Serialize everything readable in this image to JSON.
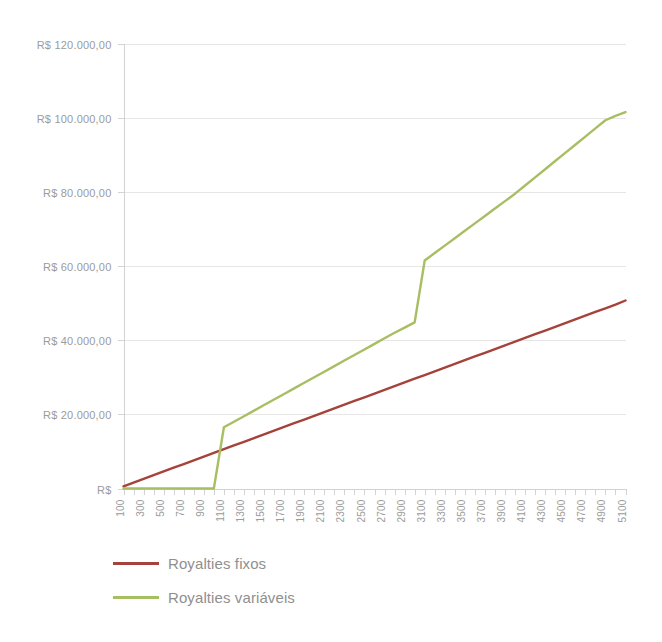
{
  "chart_data": {
    "type": "line",
    "title": "",
    "subtitle": "",
    "xlabel": "",
    "ylabel": "",
    "grid": true,
    "legend_position": "bottom-left",
    "ylim": [
      0,
      120000
    ],
    "xlim": [
      100,
      5100
    ],
    "y_ticks": [
      0,
      20000,
      40000,
      60000,
      80000,
      100000,
      120000
    ],
    "y_tick_labels": [
      "R$",
      "R$ 20.000,00",
      "R$ 40.000,00",
      "R$ 60.000,00",
      "R$ 80.000,00",
      "R$ 100.000,00",
      "R$ 120.000,00"
    ],
    "x": [
      100,
      200,
      300,
      400,
      500,
      600,
      700,
      800,
      900,
      1000,
      1100,
      1200,
      1300,
      1400,
      1500,
      1600,
      1700,
      1800,
      1900,
      2000,
      2100,
      2200,
      2300,
      2400,
      2500,
      2600,
      2700,
      2800,
      2900,
      3000,
      3100,
      3200,
      3300,
      3400,
      3500,
      3600,
      3700,
      3800,
      3900,
      4000,
      4100,
      4200,
      4300,
      4400,
      4500,
      4600,
      4700,
      4800,
      4900,
      5000,
      5100
    ],
    "x_tick_labels": [
      "100",
      "300",
      "500",
      "700",
      "900",
      "1100",
      "1300",
      "1500",
      "1700",
      "1900",
      "2100",
      "2300",
      "2500",
      "2700",
      "2900",
      "3100",
      "3300",
      "3500",
      "3700",
      "3900",
      "4100",
      "4300",
      "4500",
      "4700",
      "4900",
      "5100"
    ],
    "x_tick_label_rotation": -90,
    "series": [
      {
        "name": "Royalties fixos",
        "color": "#a5433a",
        "values": [
          600,
          1600,
          2600,
          3600,
          4600,
          5600,
          6600,
          7600,
          8600,
          9600,
          10600,
          11600,
          12600,
          13600,
          14600,
          15600,
          16600,
          17600,
          18600,
          19600,
          20600,
          21600,
          22600,
          23600,
          24600,
          25600,
          26600,
          27600,
          28600,
          29600,
          30600,
          31600,
          32600,
          33600,
          34600,
          35600,
          36600,
          37600,
          38600,
          39600,
          40600,
          41600,
          42600,
          43600,
          44600,
          45600,
          46600,
          47600,
          48600,
          49600,
          50700
        ]
      },
      {
        "name": "Royalties variáveis",
        "color": "#a8be63",
        "values": [
          0,
          0,
          0,
          0,
          0,
          0,
          0,
          0,
          0,
          0,
          16500,
          18000,
          19500,
          21000,
          22500,
          24000,
          25500,
          27000,
          28500,
          30000,
          31500,
          33000,
          34500,
          36000,
          37500,
          39000,
          40500,
          42000,
          43400,
          44800,
          61500,
          63500,
          65500,
          67500,
          69500,
          71500,
          73500,
          75500,
          77500,
          79500,
          81700,
          83900,
          86100,
          88300,
          90500,
          92700,
          94900,
          97100,
          99300,
          100500,
          101500
        ]
      }
    ]
  },
  "legend": {
    "items": [
      {
        "label": "Royalties fixos",
        "color": "#a5433a"
      },
      {
        "label": "Royalties variáveis",
        "color": "#a8be63"
      }
    ]
  },
  "colors": {
    "background": "#ffffff",
    "gridline": "#e6e6e6",
    "axis": "#d2d2d2",
    "tick_text": "#9b9b9b",
    "legend_text": "#8f8f8f",
    "series_fixos": "#a5433a",
    "series_variaveis": "#a8be63"
  }
}
